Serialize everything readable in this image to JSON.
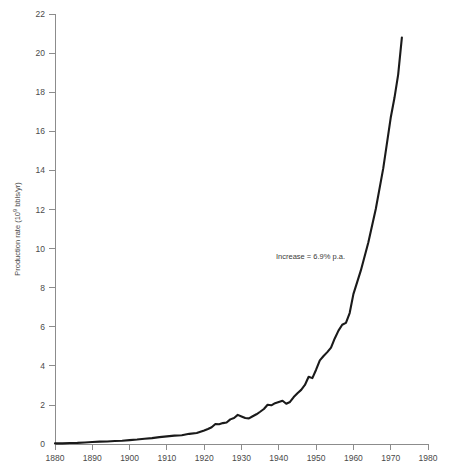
{
  "chart_data": {
    "type": "line",
    "title": "",
    "xlabel": "",
    "ylabel": "Production rate (10⁹ bbls/yr)",
    "ylabel_parts": {
      "prefix": "Production rate (10",
      "exponent": "9",
      "suffix": " bbls/yr)"
    },
    "xlim": [
      1880,
      1980
    ],
    "ylim": [
      0,
      22
    ],
    "grid": false,
    "legend": null,
    "xticks": [
      1880,
      1890,
      1900,
      1910,
      1920,
      1930,
      1940,
      1950,
      1960,
      1970,
      1980
    ],
    "xticklabels": [
      "1880",
      "1890",
      "1900",
      "1910",
      "1920",
      "1930",
      "1940",
      "1950",
      "1960",
      "1970",
      "1980"
    ],
    "yticks": [
      0,
      2,
      4,
      6,
      8,
      10,
      12,
      14,
      16,
      18,
      20,
      22
    ],
    "yticklabels": [
      "0",
      "2",
      "4",
      "6",
      "8",
      "10",
      "12",
      "14",
      "16",
      "18",
      "20",
      "22"
    ],
    "annotations": [
      {
        "text": "Increase = 6.9% p.a.",
        "x": 1949,
        "y": 9.0
      }
    ],
    "series": [
      {
        "name": "World crude oil production",
        "color": "#1a1a1a",
        "x": [
          1880,
          1882,
          1884,
          1886,
          1888,
          1890,
          1892,
          1894,
          1896,
          1898,
          1900,
          1902,
          1904,
          1906,
          1908,
          1910,
          1912,
          1914,
          1916,
          1918,
          1920,
          1921,
          1922,
          1923,
          1924,
          1925,
          1926,
          1927,
          1928,
          1929,
          1930,
          1931,
          1932,
          1933,
          1934,
          1935,
          1936,
          1937,
          1938,
          1939,
          1940,
          1941,
          1942,
          1943,
          1944,
          1945,
          1946,
          1947,
          1948,
          1949,
          1950,
          1951,
          1952,
          1953,
          1954,
          1955,
          1956,
          1957,
          1958,
          1959,
          1960,
          1962,
          1964,
          1966,
          1968,
          1970,
          1971,
          1972,
          1973
        ],
        "y": [
          0.03,
          0.03,
          0.05,
          0.06,
          0.08,
          0.1,
          0.12,
          0.13,
          0.15,
          0.17,
          0.2,
          0.23,
          0.27,
          0.3,
          0.35,
          0.39,
          0.43,
          0.45,
          0.52,
          0.56,
          0.69,
          0.77,
          0.86,
          1.02,
          1.01,
          1.07,
          1.1,
          1.26,
          1.33,
          1.49,
          1.41,
          1.33,
          1.31,
          1.42,
          1.52,
          1.65,
          1.79,
          2.01,
          1.98,
          2.09,
          2.15,
          2.21,
          2.06,
          2.15,
          2.4,
          2.6,
          2.77,
          3.02,
          3.44,
          3.37,
          3.8,
          4.28,
          4.5,
          4.7,
          4.93,
          5.4,
          5.8,
          6.1,
          6.2,
          6.7,
          7.67,
          8.88,
          10.31,
          12.02,
          14.1,
          16.69,
          17.7,
          18.9,
          20.8
        ]
      }
    ],
    "note": "Smooth exponential growth curve with small wiggles (Great Depression dip ~1930-1933, WWII plateau ~1942, plateau 1957-1958)."
  },
  "geometry": {
    "plot_left_px": 55,
    "plot_right_px": 428,
    "plot_top_px": 14,
    "plot_bottom_px": 444
  }
}
